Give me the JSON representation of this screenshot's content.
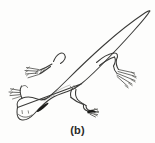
{
  "figure": {
    "caption": "(b)",
    "orientation": "head at lower left, tail at upper right",
    "background_color": "#fdfdfc",
    "ink_color": "#3a3a38",
    "eye_color": "#1d1d1b",
    "parts": {
      "head": "head",
      "eye": "eye",
      "gills": "external-gills",
      "body": "body-outline",
      "tail": "tail",
      "dorsal_fin": "dorsal-fin-bump",
      "forelimb_left": "left-forelimb",
      "hindlimb_right": "right-hindlimb",
      "hindlimb_lower": "lower-hindlimb",
      "digits": "digits"
    }
  }
}
